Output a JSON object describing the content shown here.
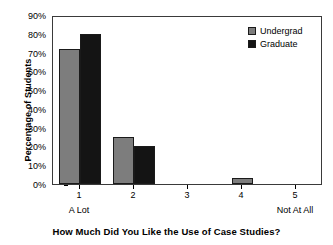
{
  "chart_data": {
    "type": "bar",
    "title": "How Much Did You Like the Use of Case Studies?",
    "xlabel": "How Much Did You Like the Use of Case Studies?",
    "ylabel": "Percentage of Students",
    "categories": [
      "1",
      "2",
      "3",
      "4",
      "5"
    ],
    "category_endpoint_labels": {
      "low": "A Lot",
      "high": "Not At All"
    },
    "series": [
      {
        "name": "Undergrad",
        "color": "#7d7d7d",
        "values": [
          72,
          25,
          0,
          3,
          0
        ]
      },
      {
        "name": "Graduate",
        "color": "#141414",
        "values": [
          80,
          20,
          0,
          0,
          0
        ]
      }
    ],
    "ylim": [
      0,
      90
    ],
    "ytick_values": [
      0,
      10,
      20,
      30,
      40,
      50,
      60,
      70,
      80,
      90
    ],
    "ytick_labels": [
      "0%",
      "10%",
      "20%",
      "30%",
      "40%",
      "50%",
      "60%",
      "70%",
      "80%",
      "90%"
    ],
    "grid": false,
    "legend_position": "top-right"
  },
  "legend": {
    "items": [
      {
        "label": "Undergrad",
        "swatch": "gray-square-swatch"
      },
      {
        "label": "Graduate",
        "swatch": "black-square-swatch"
      }
    ]
  },
  "axes": {
    "y_title": "Percentage of Students",
    "x_title": "How Much Did You Like the Use of Case Studies?",
    "x_tick_labels": [
      "1",
      "2",
      "3",
      "4",
      "5"
    ],
    "x_low_label": "A Lot",
    "x_high_label": "Not At All",
    "y_tick_labels": [
      "90%",
      "80%",
      "70%",
      "60%",
      "50%",
      "40%",
      "30%",
      "20%",
      "10%",
      "0%"
    ]
  },
  "colors": {
    "undergrad": "#7d7d7d",
    "graduate": "#141414",
    "frame": "#3a3a3a",
    "background": "#ffffff",
    "text": "#000000"
  }
}
